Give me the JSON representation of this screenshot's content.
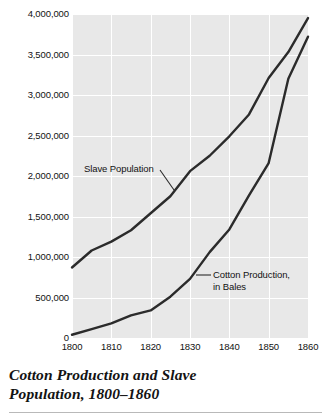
{
  "caption": {
    "line1": "Cotton Production and Slave",
    "line2": "Population, 1800–1860"
  },
  "annotations": {
    "slave": "Slave Population",
    "cotton_line1": "Cotton Production,",
    "cotton_line2": "in Bales"
  },
  "colors": {
    "plot_background": "#e8e8e8",
    "gridline": "#ffffff",
    "line": "#2b2b2b",
    "text": "#121212",
    "caption_rule": "#b9b9b9"
  },
  "chart_data": {
    "type": "line",
    "title": "Cotton Production and Slave Population, 1800–1860",
    "xlabel": "",
    "ylabel": "",
    "x": [
      1800,
      1805,
      1810,
      1815,
      1820,
      1825,
      1830,
      1835,
      1840,
      1845,
      1850,
      1855,
      1860
    ],
    "xlim": [
      1800,
      1860
    ],
    "ylim": [
      0,
      4000000
    ],
    "xticks": [
      1800,
      1810,
      1820,
      1830,
      1840,
      1850,
      1860
    ],
    "xticklabels": [
      "1800",
      "1810",
      "1820",
      "1830",
      "1840",
      "1850",
      "1860"
    ],
    "yticks": [
      0,
      500000,
      1000000,
      1500000,
      2000000,
      2500000,
      3000000,
      3500000,
      4000000
    ],
    "yticklabels": [
      "0",
      "500,000",
      "1,000,000",
      "1,500,000",
      "2,000,000",
      "2,500,000",
      "3,000,000",
      "3,500,000",
      "4,000,000"
    ],
    "grid": true,
    "legend_position": "inline-annotations",
    "series": [
      {
        "name": "Slave Population",
        "values": [
          870000,
          1080000,
          1190000,
          1330000,
          1540000,
          1750000,
          2060000,
          2250000,
          2490000,
          2760000,
          3210000,
          3530000,
          3950000
        ]
      },
      {
        "name": "Cotton Production, in Bales",
        "values": [
          40000,
          110000,
          180000,
          280000,
          340000,
          510000,
          730000,
          1060000,
          1340000,
          1760000,
          2160000,
          3200000,
          3720000
        ]
      }
    ]
  }
}
